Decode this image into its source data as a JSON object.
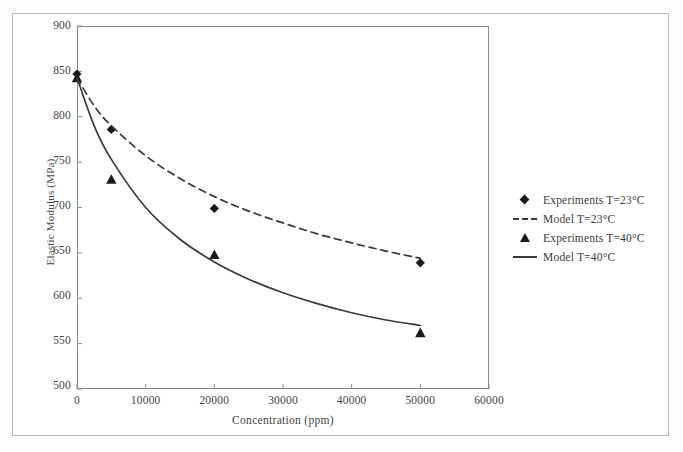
{
  "chart_data": {
    "type": "line",
    "title": "",
    "xlabel": "Concentration (ppm)",
    "ylabel": "Elastic Modulus (MPa)",
    "xlim": [
      0,
      60000
    ],
    "ylim": [
      500,
      900
    ],
    "xticks": [
      "0",
      "10000",
      "20000",
      "30000",
      "40000",
      "50000",
      "60000"
    ],
    "xtick_values": [
      0,
      10000,
      20000,
      30000,
      40000,
      50000,
      60000
    ],
    "yticks": [
      "500",
      "550",
      "600",
      "650",
      "700",
      "750",
      "800",
      "850",
      "900"
    ],
    "ytick_values": [
      500,
      550,
      600,
      650,
      700,
      750,
      800,
      850,
      900
    ],
    "grid": false,
    "legend_position": "right",
    "series": [
      {
        "name": "Experiments T=23°C",
        "marker": "diamond",
        "style": "scatter",
        "x": [
          0,
          5000,
          20000,
          50000
        ],
        "values": [
          847,
          786,
          699,
          639
        ]
      },
      {
        "name": "Model T=23°C",
        "marker": "none",
        "style": "dashed-line",
        "x": [
          0,
          2500,
          5000,
          10000,
          15000,
          20000,
          25000,
          30000,
          35000,
          40000,
          45000,
          50000
        ],
        "values": [
          843,
          812,
          790,
          757,
          732,
          712,
          696,
          683,
          671,
          661,
          652,
          644
        ]
      },
      {
        "name": "Experiments T=40°C",
        "marker": "triangle",
        "style": "scatter",
        "x": [
          0,
          5000,
          20000,
          50000
        ],
        "values": [
          843,
          731,
          648,
          562
        ]
      },
      {
        "name": "Model T=40°C",
        "marker": "none",
        "style": "solid-line",
        "x": [
          0,
          2500,
          5000,
          10000,
          15000,
          20000,
          25000,
          30000,
          35000,
          40000,
          45000,
          50000
        ],
        "values": [
          843,
          790,
          753,
          700,
          665,
          640,
          621,
          606,
          594,
          584,
          576,
          570
        ]
      }
    ]
  },
  "legend": {
    "entries": [
      {
        "label": "Experiments T=23°C",
        "key": "diamond-marker"
      },
      {
        "label": "Model T=23°C",
        "key": "dashed-line-swatch"
      },
      {
        "label": "Experiments T=40°C",
        "key": "triangle-marker"
      },
      {
        "label": "Model T=40°C",
        "key": "solid-line-swatch"
      }
    ]
  },
  "colors": {
    "marker": "#1a1a1a",
    "line": "#3a3a3a",
    "axis": "#8a8a8a",
    "frame": "#b9b9b9",
    "text": "#454545",
    "background": "#ffffff"
  }
}
